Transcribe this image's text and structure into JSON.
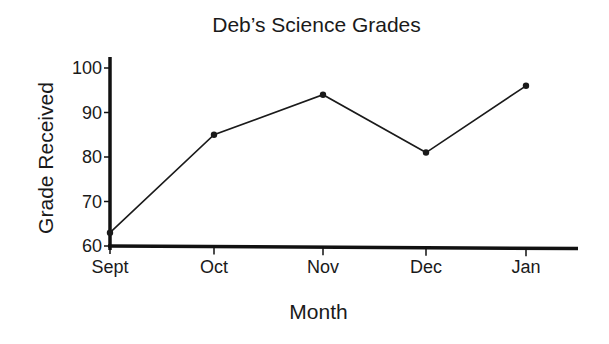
{
  "chart_data": {
    "type": "line",
    "title": "Deb’s Science Grades",
    "xlabel": "Month",
    "ylabel": "Grade Received",
    "categories": [
      "Sept",
      "Oct",
      "Nov",
      "Dec",
      "Jan"
    ],
    "series": [
      {
        "name": "Grade Received",
        "values": [
          63,
          85,
          94,
          81,
          96
        ]
      }
    ],
    "ylim": [
      60,
      100
    ],
    "yticks": [
      60,
      70,
      80,
      90,
      100
    ],
    "grid": false,
    "legend": "none",
    "colors": {
      "line": "#1a1a1a",
      "axis": "#111111",
      "background": "#ffffff"
    }
  },
  "layout": {
    "plot": {
      "x0": 110,
      "y_at_60": 246,
      "y_at_100": 68,
      "axis_right": 578
    },
    "x_positions": [
      110,
      214,
      323,
      426,
      526
    ]
  }
}
